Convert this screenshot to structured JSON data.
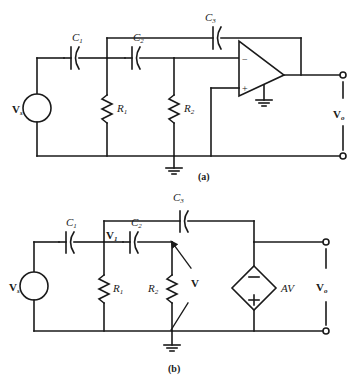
{
  "figure": {
    "stroke_color": "#1a1a1a",
    "background": "#ffffff"
  },
  "circuit_a": {
    "caption": "(a)",
    "source_label": "V",
    "source_sub": "s",
    "components": {
      "c1": {
        "label": "C",
        "sub": "1"
      },
      "c2": {
        "label": "C",
        "sub": "2"
      },
      "c3": {
        "label": "C",
        "sub": "3"
      },
      "r1": {
        "label": "R",
        "sub": "1"
      },
      "r2": {
        "label": "R",
        "sub": "2"
      }
    },
    "opamp": {
      "inverting_label": "−",
      "noninverting_label": "+",
      "name": "operational-amplifier"
    },
    "output_label": "V",
    "output_sub": "o",
    "ground_count": 2
  },
  "circuit_b": {
    "caption": "(b)",
    "source_label": "V",
    "source_sub": "s",
    "components": {
      "c1": {
        "label": "C",
        "sub": "1"
      },
      "c2": {
        "label": "C",
        "sub": "2"
      },
      "c3": {
        "label": "C",
        "sub": "3"
      },
      "r1": {
        "label": "R",
        "sub": "1"
      },
      "r2": {
        "label": "R",
        "sub": "2"
      }
    },
    "node_v1": {
      "label": "V",
      "sub": "1"
    },
    "node_v": {
      "label": "V"
    },
    "dependent_source": {
      "label": "AV",
      "plus": "+",
      "minus": "−",
      "name": "voltage-controlled-voltage-source"
    },
    "output_label": "V",
    "output_sub": "o",
    "ground_count": 1
  }
}
